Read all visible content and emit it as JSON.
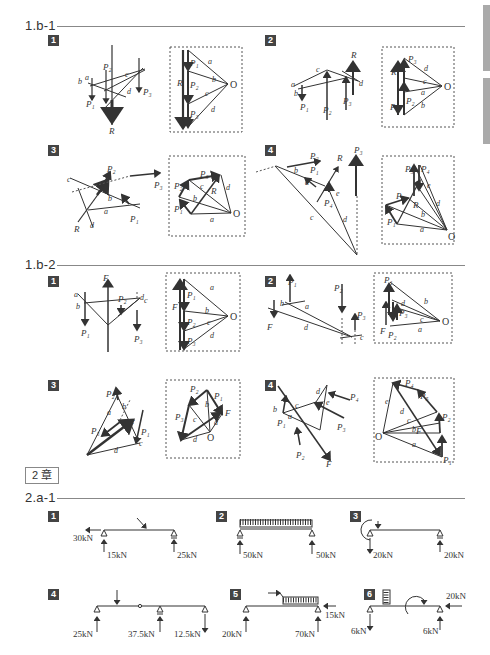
{
  "sections": [
    {
      "id": "1.b-1",
      "title": "1.b-1"
    },
    {
      "id": "1.b-2",
      "title": "1.b-2"
    },
    {
      "id": "2.a-1",
      "title": "2.a-1"
    }
  ],
  "chapter_label": "2 章",
  "badges": [
    "1",
    "2",
    "3",
    "4",
    "5",
    "6"
  ],
  "labels": {
    "P1": "P₁",
    "P2": "P₂",
    "P3": "P₃",
    "P4": "P₄",
    "P5": "P₅",
    "R": "R",
    "F": "F",
    "O": "O",
    "a": "a",
    "b": "b",
    "c": "c",
    "d": "d",
    "e": "e"
  },
  "beam_problems": [
    {
      "num": "1",
      "reactions": [
        "30kN",
        "15kN",
        "25kN"
      ]
    },
    {
      "num": "2",
      "reactions": [
        "50kN",
        "50kN"
      ]
    },
    {
      "num": "3",
      "reactions": [
        "20kN",
        "20kN"
      ]
    },
    {
      "num": "4",
      "reactions": [
        "25kN",
        "37.5kN",
        "12.5kN"
      ]
    },
    {
      "num": "5",
      "reactions": [
        "20kN",
        "70kN",
        "15kN"
      ]
    },
    {
      "num": "6",
      "reactions": [
        "6kN",
        "6kN",
        "20kN"
      ]
    }
  ],
  "colors": {
    "badge": "#444444",
    "rule": "#888888",
    "sidetab": "#aaaaaa"
  }
}
